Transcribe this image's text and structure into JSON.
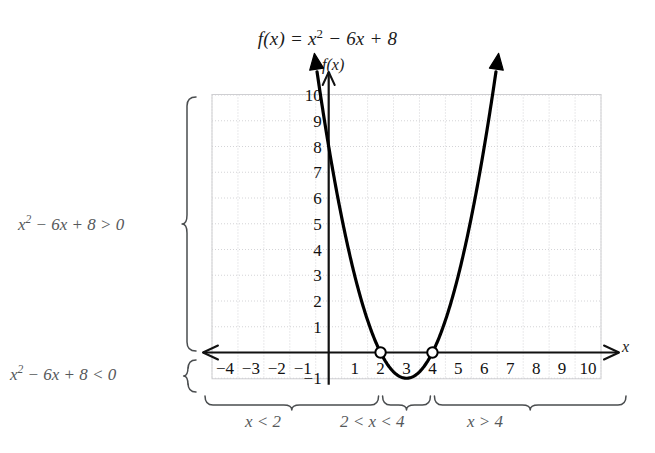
{
  "title": {
    "full": "f(x) = x² − 6x + 8",
    "lhs": "f(x) = x",
    "exponent": "2",
    "rhs": " − 6x + 8"
  },
  "axes": {
    "x_axis_label": "x",
    "y_axis_label": "f(x)",
    "x_ticks": [
      -4,
      -3,
      -2,
      -1,
      1,
      2,
      3,
      4,
      5,
      6,
      7,
      8,
      9,
      10
    ],
    "y_ticks": [
      10,
      9,
      8,
      7,
      6,
      5,
      4,
      3,
      2,
      1,
      -1
    ],
    "x_range": [
      -4.6,
      10.6
    ],
    "y_range": [
      -1.35,
      10.4
    ],
    "grid": true,
    "grid_color": "#cfcfd2",
    "axis_color": "#111111"
  },
  "annotations": {
    "left_brace_top": {
      "text": "x² − 6x + 8 > 0",
      "lhs": "x",
      "exponent": "2",
      "rhs": " − 6x + 8 > 0"
    },
    "left_brace_bottom": {
      "text": "x² − 6x + 8 < 0",
      "lhs": "x",
      "exponent": "2",
      "rhs": " − 6x + 8 < 0"
    },
    "bottom_braces": [
      {
        "label": "x < 2",
        "from": -4.5,
        "to": 2
      },
      {
        "label": "2 < x < 4",
        "from": 2,
        "to": 4
      },
      {
        "label": "x > 4",
        "from": 4,
        "to": 10.5
      }
    ]
  },
  "chart_data": {
    "type": "line",
    "xlabel": "x",
    "ylabel": "f(x)",
    "xlim": [
      -4.6,
      10.6
    ],
    "ylim": [
      -1.35,
      10.4
    ],
    "grid": true,
    "function": "f(x) = x^2 - 6x + 8",
    "vertex": [
      3,
      -1
    ],
    "roots": [
      2,
      4
    ],
    "y_intercept": 8,
    "root_marker_style": "open-circle",
    "series": [
      {
        "name": "f(x) = x² − 6x + 8",
        "x": [
          -0.45,
          0,
          0.5,
          1,
          1.5,
          2,
          2.5,
          3,
          3.5,
          4,
          4.5,
          5,
          5.5,
          6,
          6.45
        ],
        "y": [
          10.9,
          8,
          5.25,
          3,
          1.25,
          0,
          -0.75,
          -1,
          -0.75,
          0,
          1.25,
          3,
          5.25,
          8,
          10.9
        ]
      }
    ],
    "markers": [
      {
        "x": 2,
        "y": 0,
        "style": "open-circle"
      },
      {
        "x": 4,
        "y": 0,
        "style": "open-circle"
      }
    ],
    "annotations": [
      {
        "text": "x² − 6x + 8 > 0",
        "region": "y>0"
      },
      {
        "text": "x² − 6x + 8 < 0",
        "region": "y<0"
      },
      {
        "text": "x < 2",
        "interval": [
          -4.5,
          2
        ]
      },
      {
        "text": "2 < x < 4",
        "interval": [
          2,
          4
        ]
      },
      {
        "text": "x > 4",
        "interval": [
          4,
          10.5
        ]
      }
    ]
  }
}
